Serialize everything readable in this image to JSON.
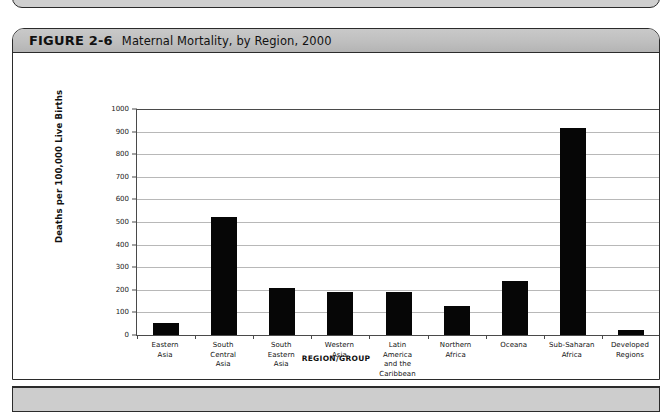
{
  "figure": {
    "number": "FIGURE 2-6",
    "caption": "Maternal Mortality, by Region, 2000"
  },
  "chart_data": {
    "type": "bar",
    "title": "Maternal Mortality, by Region, 2000",
    "xlabel": "REGION/GROUP",
    "ylabel": "Deaths per 100,000 Live Births",
    "ylim": [
      0,
      1000
    ],
    "ytick_step": 100,
    "yticks": [
      0,
      100,
      200,
      300,
      400,
      500,
      600,
      700,
      800,
      900,
      1000
    ],
    "ytick_labels": [
      "0",
      "100",
      "200",
      "300",
      "400",
      "500",
      "600",
      "700",
      "800",
      "900",
      "1000"
    ],
    "grid": true,
    "legend": false,
    "bar_color": "#060606",
    "gridline_color": "#b8b8b8",
    "axis_color": "#4a4a4a",
    "categories": [
      "Eastern Asia",
      "South Central Asia",
      "South Eastern Asia",
      "Western Asia",
      "Latin America and the Caribbean",
      "Northern Africa",
      "Oceana",
      "Sub-Saharan Africa",
      "Developed Regions"
    ],
    "category_lines": [
      [
        "Eastern",
        "Asia"
      ],
      [
        "South",
        "Central",
        "Asia"
      ],
      [
        "South",
        "Eastern",
        "Asia"
      ],
      [
        "Western",
        "Asia"
      ],
      [
        "Latin",
        "America",
        "and the",
        "Caribbean"
      ],
      [
        "Northern",
        "Africa"
      ],
      [
        "Oceana"
      ],
      [
        "Sub-Saharan",
        "Africa"
      ],
      [
        "Developed",
        "Regions"
      ]
    ],
    "values": [
      55,
      520,
      210,
      190,
      190,
      130,
      240,
      915,
      20
    ]
  }
}
